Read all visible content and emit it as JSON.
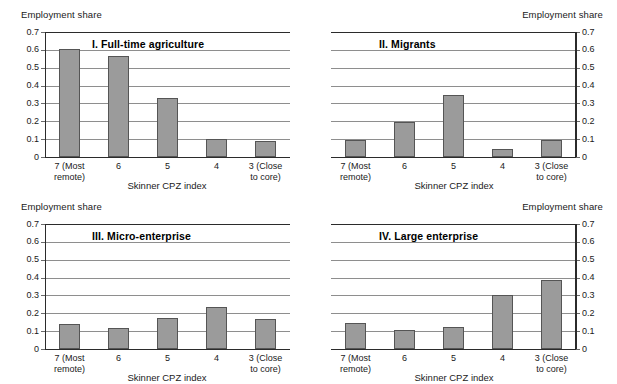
{
  "figure": {
    "yaxis_title": "Employment share",
    "xaxis_title": "Skinner CPZ index",
    "categories": [
      "7 (Most\nremote)",
      "6",
      "5",
      "4",
      "3 (Close\nto core)"
    ],
    "yticks": [
      "0.7",
      "0.6",
      "0.5",
      "0.4",
      "0.3",
      "0.2",
      "0.1",
      "0"
    ],
    "bar_color": "#9b9b9b",
    "bar_edge_color": "#555555",
    "axis_color": "#2b2b2b",
    "grid_color": "#8e8e8e"
  },
  "chart_data": [
    {
      "type": "bar",
      "panel": "I",
      "title": "I.  Full-time agriculture",
      "categories": [
        "7 (Most remote)",
        "6",
        "5",
        "4",
        "3 (Close to core)"
      ],
      "values": [
        0.605,
        0.565,
        0.333,
        0.102,
        0.088
      ],
      "xlabel": "Skinner CPZ index",
      "ylabel": "Employment share",
      "ylim": [
        0,
        0.7
      ],
      "yticks": [
        0,
        0.1,
        0.2,
        0.3,
        0.4,
        0.5,
        0.6,
        0.7
      ],
      "grid": true,
      "yaxis_position": "left",
      "legend": "none"
    },
    {
      "type": "bar",
      "panel": "II",
      "title": "II.  Migrants",
      "categories": [
        "7 (Most remote)",
        "6",
        "5",
        "4",
        "3 (Close to core)"
      ],
      "values": [
        0.095,
        0.195,
        0.345,
        0.045,
        0.095
      ],
      "xlabel": "Skinner CPZ index",
      "ylabel": "Employment share",
      "ylim": [
        0,
        0.7
      ],
      "yticks": [
        0,
        0.1,
        0.2,
        0.3,
        0.4,
        0.5,
        0.6,
        0.7
      ],
      "grid": true,
      "yaxis_position": "right",
      "legend": "none"
    },
    {
      "type": "bar",
      "panel": "III",
      "title": "III.  Micro-enterprise",
      "categories": [
        "7 (Most remote)",
        "6",
        "5",
        "4",
        "3 (Close to core)"
      ],
      "values": [
        0.138,
        0.12,
        0.175,
        0.235,
        0.168
      ],
      "xlabel": "Skinner CPZ index",
      "ylabel": "Employment share",
      "ylim": [
        0,
        0.7
      ],
      "yticks": [
        0,
        0.1,
        0.2,
        0.3,
        0.4,
        0.5,
        0.6,
        0.7
      ],
      "grid": true,
      "yaxis_position": "left",
      "legend": "none"
    },
    {
      "type": "bar",
      "panel": "IV",
      "title": "IV.  Large enterprise",
      "categories": [
        "7 (Most remote)",
        "6",
        "5",
        "4",
        "3 (Close to core)"
      ],
      "values": [
        0.145,
        0.105,
        0.122,
        0.3,
        0.385
      ],
      "xlabel": "Skinner CPZ index",
      "ylabel": "Employment share",
      "ylim": [
        0,
        0.7
      ],
      "yticks": [
        0,
        0.1,
        0.2,
        0.3,
        0.4,
        0.5,
        0.6,
        0.7
      ],
      "grid": true,
      "yaxis_position": "right",
      "legend": "none"
    }
  ]
}
